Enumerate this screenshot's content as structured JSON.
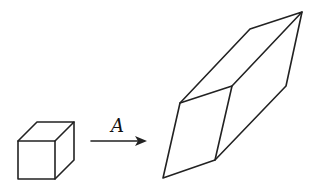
{
  "diagram": {
    "arrow_label": "A",
    "cube": {
      "front_face": [
        [
          18,
          141
        ],
        [
          55,
          141
        ],
        [
          55,
          179
        ],
        [
          18,
          179
        ]
      ],
      "back_offset": [
        19,
        -19
      ]
    },
    "parallelepiped": {
      "front_face": [
        [
          180,
          103
        ],
        [
          232,
          86
        ],
        [
          215,
          160
        ],
        [
          163,
          178
        ]
      ],
      "back_top_left": [
        250,
        29
      ],
      "back_top_right": [
        302,
        12
      ],
      "back_bottom_right": [
        286,
        86
      ]
    },
    "colors": {
      "stroke": "#222222",
      "background": "#ffffff"
    }
  }
}
